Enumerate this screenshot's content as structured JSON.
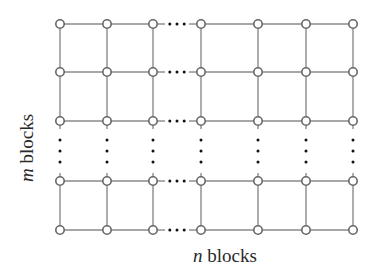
{
  "diagram": {
    "type": "grid-graph",
    "labels": {
      "horizontal": {
        "variable": "n",
        "text": " blocks"
      },
      "vertical": {
        "variable": "m",
        "text": " blocks"
      }
    },
    "colors": {
      "edge": "#8a8a8a",
      "node_stroke": "#666666",
      "node_fill": "#ffffff",
      "dots": "#111111"
    },
    "columns_x": [
      60,
      107,
      153,
      201,
      258,
      306,
      353
    ],
    "rows_y": [
      24,
      72,
      121,
      181,
      230
    ],
    "column_gap_after_index": 3,
    "row_gap_after_index": 2,
    "ellipsis": "..."
  }
}
